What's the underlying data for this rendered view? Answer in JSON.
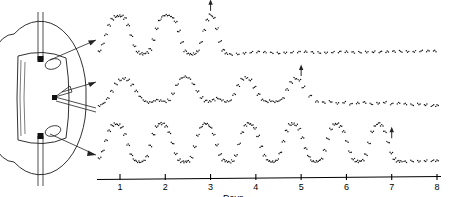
{
  "figure": {
    "name": "circadian-multiunit-recording-figure",
    "background": "#ffffff",
    "ink_color": "#111111"
  },
  "diagram": {
    "label": "coronal-brain-section-with-electrodes",
    "electrode_count": 2,
    "recording_site_count": 2,
    "lead_count": 3
  },
  "axis": {
    "title": "Days",
    "ticks": [
      "1",
      "2",
      "3",
      "4",
      "5",
      "6",
      "7",
      "8"
    ],
    "min": 1,
    "max": 8
  },
  "chart_data": {
    "type": "line",
    "title": "",
    "subtitle": "",
    "xlabel": "Days",
    "ylabel": "",
    "xlim": [
      0.55,
      8.1
    ],
    "grid": false,
    "legend": null,
    "marker_style": "dotted",
    "panels": [
      {
        "name": "top-trace",
        "label": "",
        "annotation": "arrow at final peak",
        "rhythm_cycles": 3,
        "outcome": "flat after day 3",
        "arrow_x": 3.0,
        "series": [
          {
            "name": "multiunit-activity",
            "x": [
              0.55,
              0.62,
              0.69,
              0.76,
              0.83,
              0.9,
              0.97,
              1.04,
              1.11,
              1.18,
              1.25,
              1.32,
              1.39,
              1.46,
              1.53,
              1.6,
              1.67,
              1.74,
              1.81,
              1.88,
              1.95,
              2.02,
              2.09,
              2.16,
              2.23,
              2.3,
              2.37,
              2.44,
              2.51,
              2.58,
              2.65,
              2.72,
              2.79,
              2.86,
              2.93,
              3.0,
              3.07,
              3.14,
              3.21,
              3.28,
              3.35,
              3.45,
              3.6,
              3.75,
              3.9,
              4.05,
              4.2,
              4.35,
              4.5,
              4.65,
              4.8,
              4.95,
              5.1,
              5.25,
              5.4,
              5.55,
              5.7,
              5.85,
              6.0,
              6.15,
              6.3,
              6.45,
              6.6,
              6.75,
              6.9,
              7.05,
              7.2,
              7.35,
              7.5,
              7.65,
              7.8,
              7.95
            ],
            "y": [
              14,
              30,
              52,
              74,
              88,
              94,
              96,
              95,
              90,
              74,
              50,
              26,
              12,
              8,
              7,
              10,
              18,
              40,
              66,
              86,
              95,
              97,
              96,
              92,
              82,
              60,
              34,
              14,
              7,
              6,
              8,
              14,
              34,
              62,
              86,
              98,
              92,
              66,
              36,
              16,
              8,
              6,
              7,
              9,
              11,
              12,
              11,
              10,
              9,
              10,
              11,
              12,
              12,
              11,
              10,
              10,
              11,
              12,
              12,
              11,
              11,
              12,
              12,
              12,
              12,
              13,
              13,
              13,
              13,
              14,
              14,
              14
            ]
          }
        ]
      },
      {
        "name": "middle-trace",
        "label": "",
        "annotation": "arrow at rhythm loss",
        "rhythm_cycles": 4,
        "outcome": "arrhythmic after day 5",
        "arrow_x": 5.0,
        "series": [
          {
            "name": "multiunit-activity",
            "x": [
              0.55,
              0.64,
              0.73,
              0.82,
              0.91,
              1.0,
              1.09,
              1.18,
              1.27,
              1.36,
              1.45,
              1.54,
              1.63,
              1.72,
              1.81,
              1.9,
              1.99,
              2.08,
              2.17,
              2.26,
              2.35,
              2.44,
              2.53,
              2.62,
              2.71,
              2.8,
              2.89,
              2.98,
              3.07,
              3.16,
              3.25,
              3.34,
              3.43,
              3.52,
              3.61,
              3.7,
              3.79,
              3.88,
              3.97,
              4.06,
              4.15,
              4.24,
              4.33,
              4.42,
              4.51,
              4.6,
              4.69,
              4.78,
              4.87,
              4.96,
              5.05,
              5.2,
              5.35,
              5.5,
              5.65,
              5.8,
              5.95,
              6.1,
              6.25,
              6.4,
              6.55,
              6.7,
              6.85,
              7.0,
              7.15,
              7.3,
              7.45,
              7.6,
              7.75,
              7.9,
              8.0
            ],
            "y": [
              16,
              22,
              34,
              52,
              70,
              80,
              84,
              80,
              68,
              52,
              38,
              28,
              24,
              26,
              30,
              28,
              26,
              30,
              46,
              68,
              84,
              88,
              84,
              70,
              52,
              36,
              28,
              26,
              30,
              34,
              30,
              26,
              28,
              44,
              66,
              82,
              86,
              80,
              62,
              44,
              30,
              26,
              28,
              26,
              28,
              34,
              56,
              74,
              84,
              80,
              62,
              40,
              26,
              24,
              26,
              22,
              24,
              20,
              22,
              24,
              20,
              22,
              24,
              20,
              22,
              20,
              18,
              20,
              18,
              16,
              16
            ]
          }
        ]
      },
      {
        "name": "bottom-trace",
        "label": "",
        "annotation": "arrow at final peak",
        "rhythm_cycles": 7,
        "outcome": "flat after day 7",
        "arrow_x": 7.0,
        "series": [
          {
            "name": "multiunit-activity",
            "x": [
              0.55,
              0.62,
              0.69,
              0.76,
              0.83,
              0.9,
              0.97,
              1.04,
              1.11,
              1.18,
              1.25,
              1.32,
              1.39,
              1.46,
              1.53,
              1.6,
              1.67,
              1.74,
              1.81,
              1.88,
              1.95,
              2.02,
              2.09,
              2.16,
              2.23,
              2.3,
              2.37,
              2.44,
              2.51,
              2.58,
              2.65,
              2.72,
              2.79,
              2.86,
              2.93,
              3.0,
              3.07,
              3.14,
              3.21,
              3.28,
              3.35,
              3.42,
              3.49,
              3.56,
              3.63,
              3.7,
              3.77,
              3.84,
              3.91,
              3.98,
              4.05,
              4.12,
              4.19,
              4.26,
              4.33,
              4.4,
              4.47,
              4.54,
              4.61,
              4.68,
              4.75,
              4.82,
              4.89,
              4.96,
              5.03,
              5.1,
              5.17,
              5.24,
              5.31,
              5.38,
              5.45,
              5.52,
              5.59,
              5.66,
              5.73,
              5.8,
              5.87,
              5.94,
              6.01,
              6.08,
              6.15,
              6.22,
              6.29,
              6.36,
              6.43,
              6.5,
              6.57,
              6.64,
              6.71,
              6.78,
              6.85,
              6.92,
              6.99,
              7.06,
              7.13,
              7.2,
              7.3,
              7.45,
              7.6,
              7.75,
              7.9,
              8.0
            ],
            "y": [
              18,
              34,
              58,
              80,
              92,
              96,
              94,
              88,
              72,
              48,
              26,
              14,
              10,
              9,
              12,
              22,
              46,
              72,
              90,
              97,
              96,
              90,
              76,
              52,
              28,
              14,
              10,
              9,
              11,
              20,
              44,
              70,
              88,
              96,
              95,
              88,
              72,
              48,
              26,
              14,
              10,
              9,
              12,
              24,
              50,
              76,
              92,
              97,
              94,
              86,
              68,
              44,
              24,
              13,
              10,
              10,
              14,
              30,
              56,
              80,
              94,
              97,
              93,
              84,
              64,
              40,
              22,
              12,
              10,
              11,
              16,
              36,
              62,
              84,
              95,
              96,
              90,
              78,
              56,
              32,
              16,
              11,
              10,
              13,
              26,
              52,
              78,
              92,
              97,
              92,
              78,
              54,
              30,
              16,
              11,
              10,
              10,
              11,
              11,
              12,
              12,
              12
            ]
          }
        ]
      }
    ]
  }
}
